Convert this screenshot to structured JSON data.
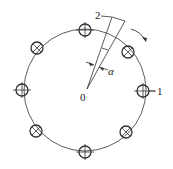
{
  "diagram": {
    "center_label": "0",
    "outer_label": "1",
    "probe_label": "2",
    "angle_label": "α",
    "colors": {
      "stroke": "#333333",
      "background": "#ffffff"
    },
    "circle": {
      "cx": 85,
      "cy": 90,
      "r": 61
    },
    "holes": [
      {
        "type": "plus",
        "x": 85,
        "y": 30
      },
      {
        "type": "cross",
        "x": 128,
        "y": 52
      },
      {
        "type": "plus",
        "x": 143,
        "y": 91
      },
      {
        "type": "cross",
        "x": 126,
        "y": 132
      },
      {
        "type": "plus",
        "x": 85,
        "y": 152
      },
      {
        "type": "cross",
        "x": 36,
        "y": 131
      },
      {
        "type": "plus",
        "x": 22,
        "y": 90
      },
      {
        "type": "cross",
        "x": 37,
        "y": 48
      }
    ]
  }
}
